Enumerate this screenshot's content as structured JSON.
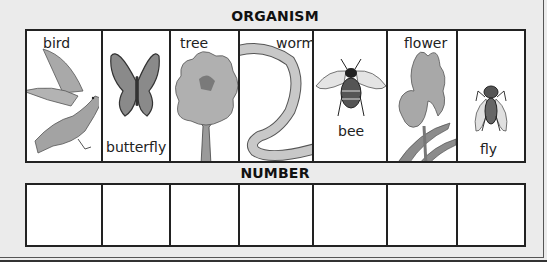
{
  "sections": {
    "organism_heading": "ORGANISM",
    "number_heading": "NUMBER"
  },
  "organisms": [
    {
      "label": "bird",
      "icon": "bird-icon",
      "label_position": "top"
    },
    {
      "label": "butterfly",
      "icon": "butterfly-icon",
      "label_position": "bottom"
    },
    {
      "label": "tree",
      "icon": "tree-icon",
      "label_position": "top"
    },
    {
      "label": "worm",
      "icon": "worm-icon",
      "label_position": "top"
    },
    {
      "label": "bee",
      "icon": "bee-icon",
      "label_position": "bottom"
    },
    {
      "label": "flower",
      "icon": "flower-icon",
      "label_position": "top"
    },
    {
      "label": "fly",
      "icon": "fly-icon",
      "label_position": "bottom"
    }
  ],
  "number_boxes": [
    "",
    "",
    "",
    "",
    "",
    "",
    ""
  ]
}
